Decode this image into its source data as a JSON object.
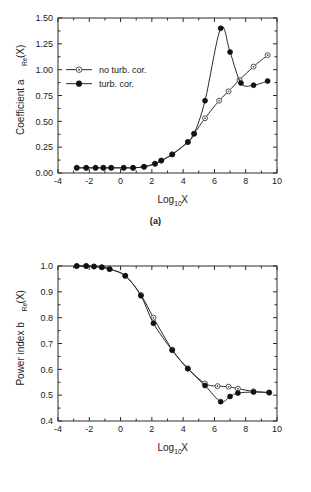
{
  "figure": {
    "background_color": "#ffffff",
    "line_color": "#2b2b2b",
    "marker_open_color": "#555555",
    "marker_filled_color": "#111111",
    "top_partial_text": ""
  },
  "panels": [
    {
      "id": "a",
      "caption": "(a)",
      "xlabel_main": "Log",
      "xlabel_sub": "10",
      "xlabel_tail": "X",
      "ylabel_main": "Coefficient a",
      "ylabel_sub": "Re",
      "ylabel_tail": "(X)",
      "xticks": [
        "-4",
        "-2",
        "0",
        "2",
        "4",
        "6",
        "8",
        "10"
      ],
      "yticks": [
        "0.00",
        "0.25",
        "0.50",
        "0.75",
        "1.00",
        "1.25",
        "1.50"
      ],
      "legend": [
        {
          "label": "no turb. cor.",
          "marker": "open-circle-marker"
        },
        {
          "label": "turb. cor.",
          "marker": "filled-circle-marker"
        }
      ]
    },
    {
      "id": "b",
      "caption": "(b)",
      "xlabel_main": "Log",
      "xlabel_sub": "10",
      "xlabel_tail": "X",
      "ylabel_main": "Power index  b",
      "ylabel_sub": "Re",
      "ylabel_tail": "(X)",
      "xticks": [
        "-4",
        "-2",
        "0",
        "2",
        "4",
        "6",
        "8",
        "10"
      ],
      "yticks": [
        "0.4",
        "0.5",
        "0.6",
        "0.7",
        "0.8",
        "0.9",
        "1.0"
      ],
      "legend": []
    }
  ],
  "chart_data": [
    {
      "type": "line",
      "panel": "a",
      "title": "",
      "xlabel": "Log10X",
      "ylabel": "Coefficient a_Re(X)",
      "xlim": [
        -4,
        10
      ],
      "ylim": [
        0.0,
        1.5
      ],
      "xticks": [
        -4,
        -2,
        0,
        2,
        4,
        6,
        8,
        10
      ],
      "yticks": [
        0.0,
        0.25,
        0.5,
        0.75,
        1.0,
        1.25,
        1.5
      ],
      "grid": false,
      "legend_position": "upper-left",
      "series": [
        {
          "name": "no turb. cor.",
          "marker": "open-circle",
          "x": [
            -2.8,
            -2.2,
            -1.6,
            -1.1,
            -0.6,
            0.2,
            0.8,
            1.5,
            2.2,
            2.6,
            3.3,
            4.3,
            4.7,
            5.4,
            6.3,
            6.9,
            7.6,
            8.5,
            9.4
          ],
          "y": [
            0.05,
            0.05,
            0.05,
            0.05,
            0.05,
            0.05,
            0.05,
            0.06,
            0.09,
            0.12,
            0.18,
            0.3,
            0.38,
            0.53,
            0.7,
            0.79,
            0.9,
            1.03,
            1.14
          ]
        },
        {
          "name": "turb. cor.",
          "marker": "filled-circle",
          "x": [
            -2.8,
            -2.2,
            -1.6,
            -1.1,
            -0.6,
            0.2,
            0.8,
            1.5,
            2.2,
            2.6,
            3.3,
            4.3,
            4.7,
            5.4,
            6.4,
            7.0,
            7.7,
            8.5,
            9.4
          ],
          "y": [
            0.05,
            0.05,
            0.05,
            0.05,
            0.05,
            0.05,
            0.05,
            0.06,
            0.09,
            0.12,
            0.18,
            0.3,
            0.38,
            0.7,
            1.4,
            1.17,
            0.87,
            0.85,
            0.89
          ]
        }
      ]
    },
    {
      "type": "line",
      "panel": "b",
      "title": "",
      "xlabel": "Log10X",
      "ylabel": "Power index b_Re(X)",
      "xlim": [
        -4,
        10
      ],
      "ylim": [
        0.4,
        1.0
      ],
      "xticks": [
        -4,
        -2,
        0,
        2,
        4,
        6,
        8,
        10
      ],
      "yticks": [
        0.4,
        0.5,
        0.6,
        0.7,
        0.8,
        0.9,
        1.0
      ],
      "grid": false,
      "legend_position": "none",
      "series": [
        {
          "name": "no turb. cor.",
          "marker": "open-circle",
          "x": [
            -2.8,
            -2.2,
            -1.7,
            -1.2,
            -0.7,
            0.3,
            1.3,
            2.1,
            3.3,
            4.3,
            5.4,
            6.2,
            6.9,
            7.5,
            8.5,
            9.5
          ],
          "y": [
            1.0,
            1.0,
            0.998,
            0.995,
            0.988,
            0.962,
            0.888,
            0.8,
            0.676,
            0.604,
            0.545,
            0.535,
            0.533,
            0.525,
            0.515,
            0.51
          ]
        },
        {
          "name": "turb. cor.",
          "marker": "filled-circle",
          "x": [
            -2.8,
            -2.2,
            -1.7,
            -1.2,
            -0.7,
            0.3,
            1.3,
            2.1,
            3.3,
            4.3,
            5.4,
            6.4,
            7.0,
            7.5,
            8.5,
            9.5
          ],
          "y": [
            1.0,
            1.0,
            0.998,
            0.995,
            0.988,
            0.962,
            0.885,
            0.778,
            0.674,
            0.602,
            0.537,
            0.475,
            0.495,
            0.508,
            0.512,
            0.51
          ]
        }
      ]
    }
  ]
}
